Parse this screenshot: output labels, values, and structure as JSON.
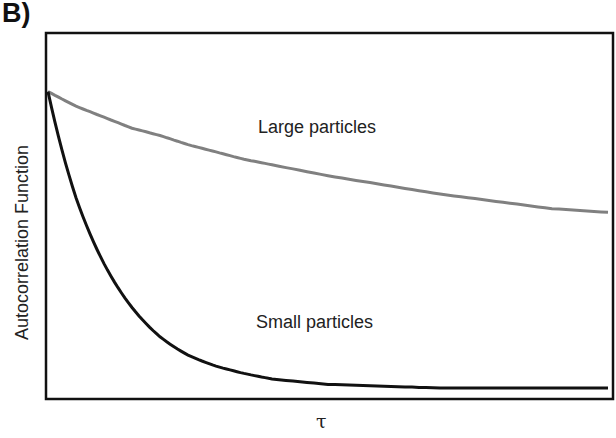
{
  "panel_label": "B)",
  "chart_data": {
    "type": "line",
    "title": "",
    "xlabel": "τ",
    "ylabel": "Autocorrelation Function",
    "x_ticks": [],
    "y_ticks": [],
    "grid": false,
    "legend": "none (inline annotations)",
    "xlim": [
      0,
      1
    ],
    "ylim": [
      0,
      1
    ],
    "x": [
      0,
      0.05,
      0.1,
      0.15,
      0.2,
      0.25,
      0.3,
      0.35,
      0.4,
      0.5,
      0.6,
      0.7,
      0.8,
      0.9,
      1.0
    ],
    "series": [
      {
        "name": "Large particles",
        "color": "#808080",
        "values": [
          0.84,
          0.8,
          0.77,
          0.74,
          0.72,
          0.695,
          0.675,
          0.655,
          0.64,
          0.61,
          0.585,
          0.56,
          0.54,
          0.52,
          0.51
        ]
      },
      {
        "name": "Small particles",
        "color": "#111111",
        "values": [
          0.84,
          0.55,
          0.37,
          0.25,
          0.17,
          0.12,
          0.09,
          0.07,
          0.055,
          0.04,
          0.035,
          0.03,
          0.03,
          0.03,
          0.03
        ]
      }
    ],
    "annotations": [
      {
        "text": "Large particles",
        "near_series": "Large particles"
      },
      {
        "text": "Small particles",
        "near_series": "Small particles"
      }
    ]
  }
}
